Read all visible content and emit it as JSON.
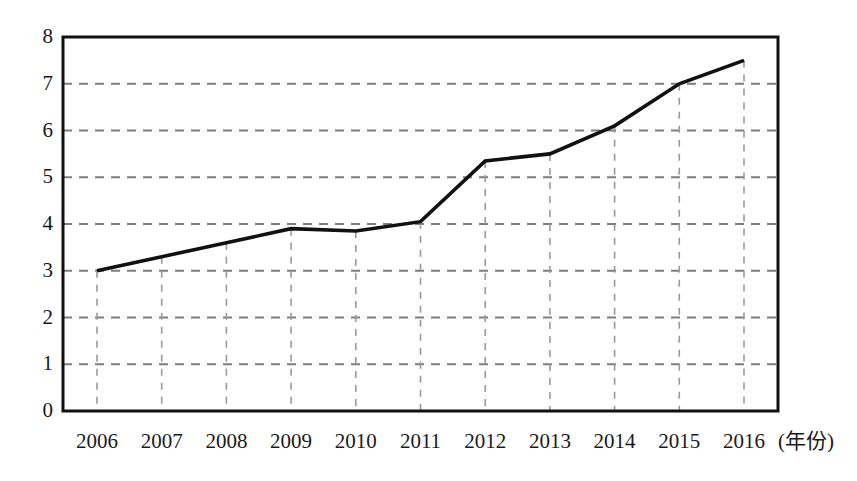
{
  "chart_data": {
    "type": "line",
    "title": "",
    "subtitle": "",
    "xlabel": "(年份)",
    "ylabel": "",
    "x": [
      2006,
      2007,
      2008,
      2009,
      2010,
      2011,
      2012,
      2013,
      2014,
      2015,
      2016
    ],
    "categories": [
      "2006",
      "2007",
      "2008",
      "2009",
      "2010",
      "2011",
      "2012",
      "2013",
      "2014",
      "2015",
      "2016"
    ],
    "values": [
      3.0,
      3.3,
      3.6,
      3.9,
      3.85,
      4.05,
      5.35,
      5.5,
      6.1,
      7.0,
      7.5
    ],
    "series": [
      {
        "name": "",
        "values": [
          3.0,
          3.3,
          3.6,
          3.9,
          3.85,
          4.05,
          5.35,
          5.5,
          6.1,
          7.0,
          7.5
        ],
        "color": "#111111"
      }
    ],
    "ylim": [
      0,
      8
    ],
    "xlim": [
      2006,
      2016
    ],
    "y_ticks": [
      0,
      1,
      2,
      3,
      4,
      5,
      6,
      7,
      8
    ],
    "y_tick_labels": [
      "0",
      "1",
      "2",
      "3",
      "4",
      "5",
      "6",
      "7",
      "8"
    ],
    "x_ticks": [
      2006,
      2007,
      2008,
      2009,
      2010,
      2011,
      2012,
      2013,
      2014,
      2015,
      2016
    ],
    "x_tick_labels": [
      "2006",
      "2007",
      "2008",
      "2009",
      "2010",
      "2011",
      "2012",
      "2013",
      "2014",
      "2015",
      "2016"
    ],
    "grid": {
      "horizontal": true,
      "vertical": true,
      "style": "dashed",
      "color": "#8c8c8c"
    },
    "legend": {
      "visible": false,
      "position": "none",
      "entries": []
    },
    "annotations": [],
    "axis_unit_suffix": "(年份)",
    "frame": {
      "visible": true,
      "color": "#111111"
    }
  },
  "colors": {
    "background": "#ffffff",
    "line": "#111111",
    "frame": "#111111",
    "grid_horizontal": "#7d7d7d",
    "grid_vertical": "#9a9a9a",
    "text": "#1a1a1a"
  },
  "geometry": {
    "plot_left": 63,
    "plot_right": 778,
    "plot_top": 37,
    "plot_bottom": 411,
    "x_first_tick": 97,
    "x_last_tick": 744
  }
}
